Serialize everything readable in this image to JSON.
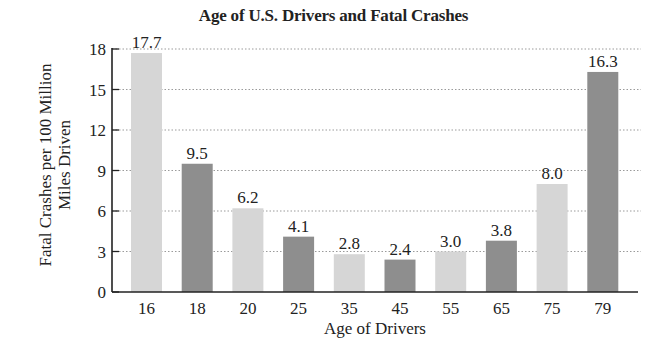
{
  "chart_data": {
    "type": "bar",
    "title": "Age of U.S. Drivers and Fatal Crashes",
    "xlabel": "Age of Drivers",
    "ylabel": "Fatal Crashes per 100 Million Miles Driven",
    "ylabel_lines": [
      "Fatal Crashes per 100 Million",
      "Miles Driven"
    ],
    "categories": [
      "16",
      "18",
      "20",
      "25",
      "35",
      "45",
      "55",
      "65",
      "75",
      "79"
    ],
    "values": [
      17.7,
      9.5,
      6.2,
      4.1,
      2.8,
      2.4,
      3.0,
      3.8,
      8.0,
      16.3
    ],
    "value_labels": [
      "17.7",
      "9.5",
      "6.2",
      "4.1",
      "2.8",
      "2.4",
      "3.0",
      "3.8",
      "8.0",
      "16.3"
    ],
    "bar_shades": [
      "light",
      "dark",
      "light",
      "dark",
      "light",
      "dark",
      "light",
      "dark",
      "light",
      "dark"
    ],
    "ylim": [
      0,
      18
    ],
    "yticks": [
      0,
      3,
      6,
      9,
      12,
      15,
      18
    ],
    "grid": "horizontal dotted",
    "legend": null
  },
  "colors": {
    "light_bar": "#d6d6d6",
    "dark_bar": "#8e8e8e",
    "axis": "#222222",
    "grid": "#9a9a9a"
  }
}
